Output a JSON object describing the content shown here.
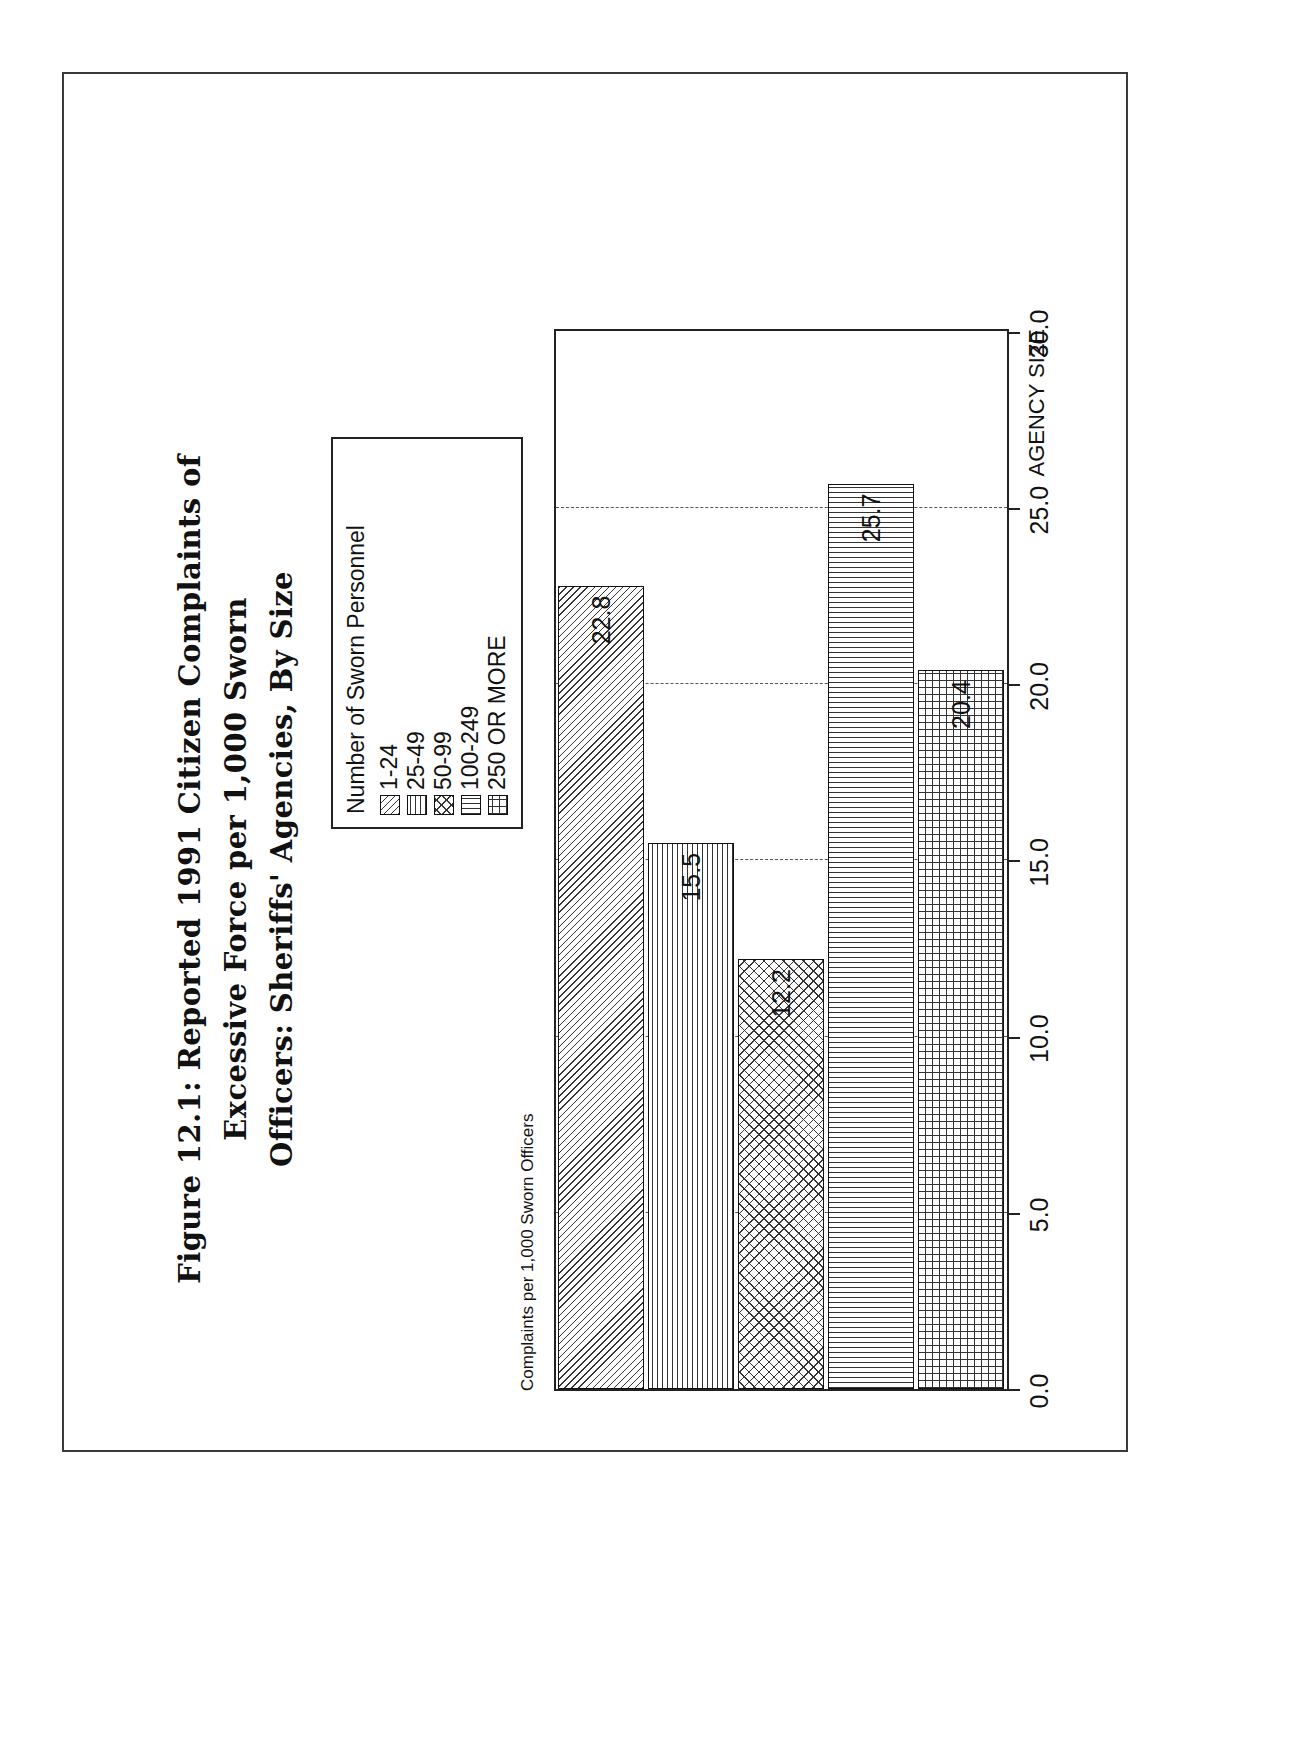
{
  "figure": {
    "title_lines": [
      "Figure 12.1: Reported 1991 Citizen Complaints of",
      "Excessive Force per 1,000 Sworn",
      "Officers: Sheriffs' Agencies, By Size"
    ]
  },
  "legend": {
    "title": "Number of Sworn Personnel",
    "items": [
      {
        "label": "1-24",
        "pattern": "diagonal-hatch"
      },
      {
        "label": "25-49",
        "pattern": "horizontal-hatch"
      },
      {
        "label": "50-99",
        "pattern": "diagonal-crosshatch"
      },
      {
        "label": "100-249",
        "pattern": "vertical-hatch"
      },
      {
        "label": "250 OR MORE",
        "pattern": "grid-hatch"
      }
    ]
  },
  "chart_data": {
    "type": "bar",
    "orientation": "horizontal",
    "title": "Figure 12.1: Reported 1991 Citizen Complaints of Excessive Force per 1,000 Sworn Officers: Sheriffs' Agencies, By Size",
    "categories": [
      "1-24",
      "25-49",
      "50-99",
      "100-249",
      "250 OR MORE"
    ],
    "values": [
      22.8,
      15.5,
      12.2,
      25.7,
      20.4
    ],
    "value_labels": [
      "22.8",
      "15.5",
      "12.2",
      "25.7",
      "20.4"
    ],
    "series": [
      {
        "name": "Complaints per 1,000 Sworn Officers",
        "values": [
          22.8,
          15.5,
          12.2,
          25.7,
          20.4
        ]
      }
    ],
    "xlabel": "AGENCY SIZE",
    "ylabel": "Complaints per 1,000 Sworn Officers",
    "ylim": [
      0.0,
      30.0
    ],
    "yticks": [
      30.0,
      25.0,
      20.0,
      15.0,
      10.0,
      5.0,
      0.0
    ],
    "ytick_labels": [
      "30.0",
      "25.0",
      "20.0",
      "15.0",
      "10.0",
      "5.0",
      "0.0"
    ],
    "grid": true,
    "grid_style": "dashed",
    "legend_position": "top-right",
    "bar_patterns": [
      "diagonal-hatch",
      "horizontal-hatch",
      "diagonal-crosshatch",
      "vertical-hatch",
      "grid-hatch"
    ],
    "colors": {
      "ink": "#111111",
      "background": "#ffffff",
      "grid": "#555555"
    }
  }
}
